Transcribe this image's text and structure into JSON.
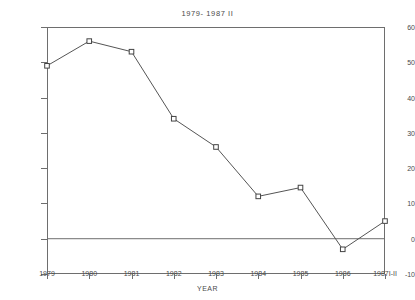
{
  "chart_data": {
    "type": "line",
    "title": "1979- 1987 II",
    "xlabel": "YEAR",
    "ylabel": "",
    "categories": [
      "1979",
      "1980",
      "1981",
      "1982",
      "1983",
      "1984",
      "1985",
      "1986",
      "1987I-II"
    ],
    "values": [
      49,
      56,
      53,
      34,
      26,
      12,
      14.5,
      -3,
      5
    ],
    "ylim": [
      -10,
      60
    ],
    "yticks": [
      -10,
      0,
      10,
      20,
      30,
      40,
      50,
      60
    ],
    "ytick_labels": [
      "-10",
      "0",
      "10",
      "20",
      "30",
      "40",
      "50",
      "60"
    ],
    "grid": false,
    "legend": "none",
    "zero_reference_line": 0,
    "marker": "square",
    "line_color": "#555555",
    "marker_fill": "#ffffff",
    "axis_color": "#6e6e6e"
  }
}
